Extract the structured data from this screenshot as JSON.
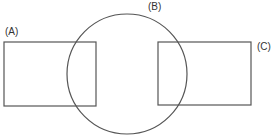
{
  "diagram": {
    "stroke_color": "#555555",
    "label_color": "#333333",
    "background": "#ffffff",
    "shapes": {
      "A": {
        "type": "rectangle",
        "label": "(A)",
        "x": 4,
        "y": 42,
        "width": 92,
        "height": 64
      },
      "B": {
        "type": "circle",
        "label": "(B)",
        "cx": 127,
        "cy": 74,
        "r": 60
      },
      "C": {
        "type": "rectangle",
        "label": "(C)",
        "x": 158,
        "y": 42,
        "width": 93,
        "height": 63
      }
    },
    "labels": {
      "A": {
        "text": "(A)",
        "x": 5,
        "y": 27
      },
      "B": {
        "text": "(B)",
        "x": 148,
        "y": 2
      },
      "C": {
        "text": "(C)",
        "x": 257,
        "y": 42
      }
    }
  }
}
